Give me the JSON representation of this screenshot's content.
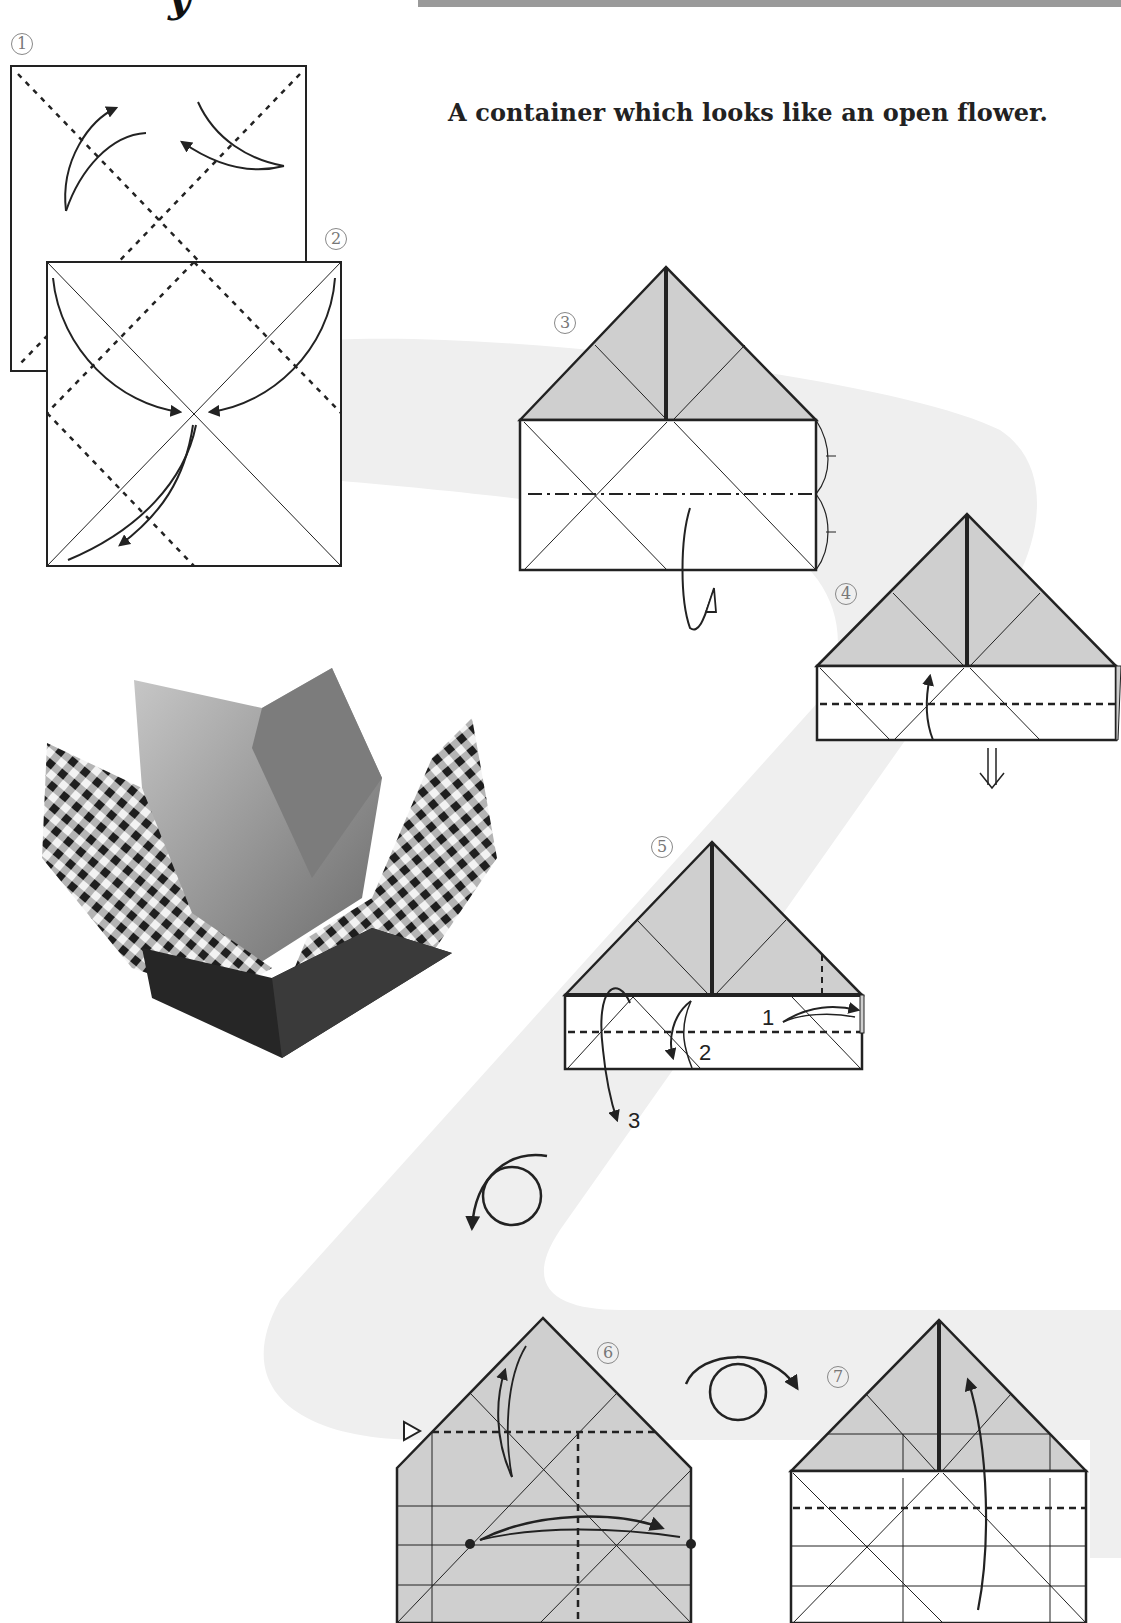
{
  "header": {
    "title_fragment": "y",
    "subtitle": "A container which looks like an open flower."
  },
  "steps": [
    {
      "number": "1",
      "label": "step-1"
    },
    {
      "number": "2",
      "label": "step-2"
    },
    {
      "number": "3",
      "label": "step-3"
    },
    {
      "number": "4",
      "label": "step-4"
    },
    {
      "number": "5",
      "label": "step-5"
    },
    {
      "number": "6",
      "label": "step-6"
    },
    {
      "number": "7",
      "label": "step-7"
    }
  ],
  "step5_annotations": {
    "a1": "1",
    "a2": "2",
    "a3": "3"
  },
  "photo": {
    "description": "Folded paper flower container with gingham check outside and plain interior"
  },
  "colors": {
    "paper_shade": "#cfcfcf",
    "background_swoosh": "#efefef",
    "line": "#222222",
    "top_bar": "#9a9a9a"
  },
  "symbols": {
    "valley_fold": "dashed-line",
    "mountain_fold": "dash-dot-line",
    "turn_over": "circle-arrow-icon",
    "push_in": "hollow-triangle-icon",
    "next_view": "double-down-arrow-icon"
  }
}
